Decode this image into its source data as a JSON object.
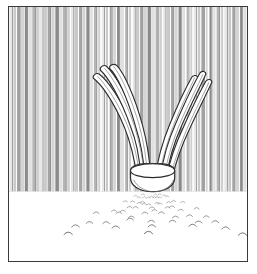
{
  "artwork": {
    "title": "Botanical line drawing of a clump of strap-shaped leaves",
    "subject": "plant-clump",
    "style": "pen-and-ink line art",
    "palette": {
      "ink": "#3a3a3a",
      "outline": "#2b2b2b",
      "paper": "#ffffff",
      "stripe_light": "#e6e6e6",
      "stripe_mid": "#c9c9c9",
      "stripe_dark": "#a3a3a3",
      "stripe_darker": "#8a8a8a",
      "ground_mark": "#6d6d6d"
    },
    "frame": {
      "name": "rectangular-ink-border",
      "x": 8,
      "y": 6,
      "width": 240,
      "height": 256,
      "stroke": "#3a3a3a",
      "stroke_width": 1.5
    },
    "regions": [
      {
        "name": "striped-backdrop",
        "description": "dense vertical hatching filling the upper two thirds",
        "y_top": 7,
        "y_bottom": 191
      },
      {
        "name": "horizon-line",
        "description": "base of the vertical hatching where small arc marks sit",
        "y": 191
      },
      {
        "name": "foreground-ground",
        "description": "blank white ground plane below the horizon",
        "y_top": 191,
        "y_bottom": 261
      }
    ],
    "backdrop": {
      "name": "vertical-stripe-field",
      "stripe_count": 62,
      "stripe_width_px": 3.9,
      "tone_sequence": [
        "#e6e6e6",
        "#c9c9c9",
        "#a3a3a3",
        "#d4d4d4",
        "#8a8a8a",
        "#e0e0e0",
        "#b5b5b5",
        "#cfcfcf"
      ]
    },
    "plant": {
      "name": "leaf-clump",
      "leaf_count": 6,
      "base": {
        "name": "bulb-collar",
        "cx": 144,
        "cy": 180,
        "rx": 15,
        "ry": 10,
        "description": "rounded collar or small pot at the base of the leaves"
      },
      "leaves": [
        {
          "id": 1,
          "side": "left",
          "tip_x": 92,
          "tip_y": 76,
          "description": "outermost left blade, arcs up and left"
        },
        {
          "id": 2,
          "side": "left",
          "tip_x": 100,
          "tip_y": 71,
          "description": "middle left blade"
        },
        {
          "id": 3,
          "side": "left",
          "tip_x": 112,
          "tip_y": 70,
          "description": "inner left blade"
        },
        {
          "id": 4,
          "side": "right",
          "tip_x": 192,
          "tip_y": 79,
          "description": "inner right blade"
        },
        {
          "id": 5,
          "side": "right",
          "tip_x": 200,
          "tip_y": 76,
          "description": "middle right blade"
        },
        {
          "id": 6,
          "side": "right",
          "tip_x": 206,
          "tip_y": 83,
          "description": "outermost right blade"
        }
      ]
    },
    "ground_marks": {
      "name": "scattered-arc-marks",
      "count": 58,
      "description": "small curved tick marks fanning out from the plant base in perspective",
      "rows": 7
    }
  }
}
